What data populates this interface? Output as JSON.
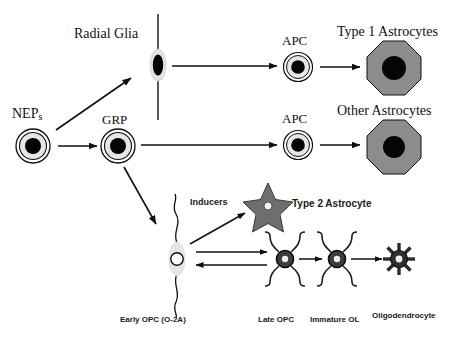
{
  "figure": {
    "type": "biological-lineage-diagram",
    "background_color": "#ffffff",
    "ink_color": "#101010",
    "cell_fill_gray": "#8c8c8c",
    "cell_fill_light": "#e0e0e0",
    "nucleus_black": "#050505"
  },
  "labels": {
    "neps": "NEP",
    "neps_subscript": "s",
    "radial_glia": "Radial Glia",
    "grp": "GRP",
    "apc_top": "APC",
    "apc_bottom": "APC",
    "type1_astrocytes": "Type 1 Astrocytes",
    "other_astrocytes": "Other Astrocytes",
    "inducers": "Inducers",
    "type2_astrocyte": "Type 2 Astrocyte",
    "early_opc": "Early OPC (O-2A)",
    "late_opc": "Late OPC",
    "immature_ol": "Immature OL",
    "oligodendrocyte": "Oligodendrocyte"
  },
  "nodes": [
    {
      "key": "neps",
      "label": "NEPs",
      "shape": "concentric-circle",
      "x": 33,
      "y": 145
    },
    {
      "key": "radial_glia",
      "label": "Radial Glia",
      "shape": "elongated-oval-with-fiber",
      "x": 158,
      "y": 65
    },
    {
      "key": "grp",
      "label": "GRP",
      "shape": "concentric-circle",
      "x": 118,
      "y": 145
    },
    {
      "key": "apc_top",
      "label": "APC",
      "shape": "concentric-circle",
      "x": 298,
      "y": 67
    },
    {
      "key": "apc_bottom",
      "label": "APC",
      "shape": "concentric-circle",
      "x": 298,
      "y": 144
    },
    {
      "key": "type1_astrocytes",
      "label": "Type 1 Astrocytes",
      "shape": "octagon",
      "x": 394,
      "y": 68
    },
    {
      "key": "other_astrocytes",
      "label": "Other Astrocytes",
      "shape": "octagon",
      "x": 394,
      "y": 147
    },
    {
      "key": "early_opc",
      "label": "Early OPC (O-2A)",
      "shape": "bipolar-cell",
      "x": 177,
      "y": 259
    },
    {
      "key": "type2_astrocyte",
      "label": "Type 2 Astrocyte",
      "shape": "star",
      "x": 268,
      "y": 204
    },
    {
      "key": "late_opc",
      "label": "Late OPC",
      "shape": "four-process-cell",
      "x": 285,
      "y": 259
    },
    {
      "key": "immature_ol",
      "label": "Immature OL",
      "shape": "four-process-cell",
      "x": 337,
      "y": 259
    },
    {
      "key": "oligodendrocyte",
      "label": "Oligodendrocyte",
      "shape": "sunburst-cell",
      "x": 399,
      "y": 262
    }
  ],
  "edges": [
    {
      "from": "neps",
      "to": "radial_glia",
      "style": "single-arrow-diagonal-up"
    },
    {
      "from": "neps",
      "to": "grp",
      "style": "single-arrow-right"
    },
    {
      "from": "radial_glia",
      "to": "apc_top",
      "style": "single-arrow-right"
    },
    {
      "from": "apc_top",
      "to": "type1_astrocytes",
      "style": "single-arrow-right"
    },
    {
      "from": "grp",
      "to": "apc_bottom",
      "style": "single-arrow-right"
    },
    {
      "from": "apc_bottom",
      "to": "other_astrocytes",
      "style": "single-arrow-right"
    },
    {
      "from": "grp",
      "to": "early_opc",
      "style": "single-arrow-diagonal-down"
    },
    {
      "from": "early_opc",
      "to": "type2_astrocyte",
      "style": "single-arrow-diagonal-up",
      "annotation": "Inducers"
    },
    {
      "from": "early_opc",
      "to": "late_opc",
      "style": "double-arrow-bidirectional"
    },
    {
      "from": "late_opc",
      "to": "immature_ol",
      "style": "single-arrow-right"
    },
    {
      "from": "immature_ol",
      "to": "oligodendrocyte",
      "style": "single-arrow-right"
    }
  ]
}
